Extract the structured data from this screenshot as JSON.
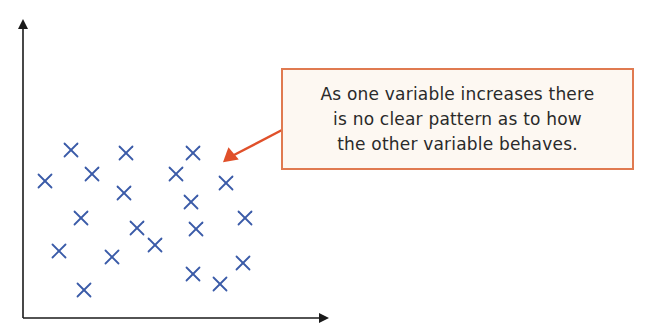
{
  "callout": {
    "lines": [
      "As one variable increases there",
      "is no clear pattern as to how",
      "the other variable behaves."
    ]
  },
  "colors": {
    "axis": "#1a1a1a",
    "marker": "#3a5ba8",
    "callout_border": "#e07a50",
    "callout_fill": "#fdf8f2",
    "arrow": "#e0502a"
  },
  "chart_data": {
    "type": "scatter",
    "title": "",
    "xlabel": "",
    "ylabel": "",
    "marker": "x",
    "grid": false,
    "axes": "arrows, no ticks",
    "annotation": "As one variable increases there is no clear pattern as to how the other variable behaves.",
    "points_px": [
      [
        71,
        150
      ],
      [
        126,
        153
      ],
      [
        193,
        153
      ],
      [
        45,
        181
      ],
      [
        92,
        174
      ],
      [
        176,
        174
      ],
      [
        226,
        183
      ],
      [
        124,
        193
      ],
      [
        191,
        202
      ],
      [
        81,
        218
      ],
      [
        245,
        218
      ],
      [
        137,
        228
      ],
      [
        196,
        229
      ],
      [
        155,
        245
      ],
      [
        59,
        251
      ],
      [
        112,
        257
      ],
      [
        243,
        263
      ],
      [
        193,
        274
      ],
      [
        220,
        284
      ],
      [
        84,
        290
      ]
    ]
  }
}
